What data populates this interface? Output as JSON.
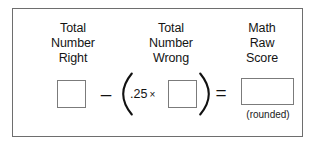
{
  "worksheet": {
    "columns": [
      {
        "id": "total-number-right",
        "lines": [
          "Total",
          "Number",
          "Right"
        ]
      },
      {
        "id": "total-number-wrong",
        "lines": [
          "Total",
          "Number",
          "Wrong"
        ]
      },
      {
        "id": "math-raw-score",
        "lines": [
          "Math",
          "Raw",
          "Score"
        ]
      }
    ],
    "formula": {
      "minus_operator": "–",
      "equals_operator": "=",
      "open_paren": "(",
      "close_paren": ")",
      "coefficient": ".25",
      "times_operator": "×",
      "box_right_value": "",
      "box_wrong_value": "",
      "box_score_value": "",
      "rounded_note": "(rounded)"
    },
    "colors": {
      "frame_border": "#6e6e6e",
      "box_border": "#7b7b7b",
      "text": "#141414",
      "background": "#ffffff"
    }
  }
}
